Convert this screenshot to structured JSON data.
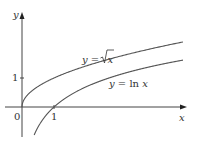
{
  "chart_data": {
    "type": "line",
    "title": "",
    "xlabel": "x",
    "ylabel": "y",
    "x_ticks": [
      "0",
      "1"
    ],
    "y_ticks": [
      "1"
    ],
    "xlim": [
      -0.5,
      5.2
    ],
    "ylim": [
      -0.97,
      3.2
    ],
    "grid": false,
    "legend_position": "inline annotations",
    "series": [
      {
        "name": "y = √x",
        "function": "sqrt(x)",
        "x": [
          0,
          0.25,
          0.5,
          1,
          2,
          3,
          4,
          5
        ],
        "values": [
          0,
          0.5,
          0.71,
          1,
          1.41,
          1.73,
          2,
          2.24
        ]
      },
      {
        "name": "y = ln x",
        "function": "ln(x)",
        "x": [
          0.38,
          0.5,
          1,
          2,
          3,
          4,
          5
        ],
        "values": [
          -0.97,
          -0.69,
          0,
          0.69,
          1.1,
          1.39,
          1.61
        ]
      }
    ],
    "annotations": [
      "y = √x",
      "y = ln x"
    ]
  },
  "labels": {
    "y_axis": "y",
    "x_axis": "x",
    "origin": "0",
    "x_tick_1": "1",
    "y_tick_1": "1",
    "sqrt_label_prefix": "y = ",
    "sqrt_label_var": "x",
    "ln_label_prefix": "y = ln ",
    "ln_label_var": "x"
  }
}
